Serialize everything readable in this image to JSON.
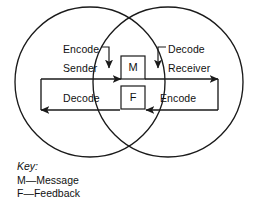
{
  "diagram": {
    "type": "venn-two-circle-communication-model",
    "labels": {
      "encode_left": "Encode",
      "sender": "Sender",
      "decode_left": "Decode",
      "decode_right": "Decode",
      "receiver": "Receiver",
      "encode_right": "Encode"
    },
    "center_boxes": [
      {
        "glyph": "M",
        "meaning": "Message"
      },
      {
        "glyph": "F",
        "meaning": "Feedback"
      }
    ],
    "colors": {
      "stroke": "#1a1a1a",
      "text": "#111111",
      "background": "#ffffff"
    }
  },
  "key": {
    "title": "Key:",
    "entries": [
      "M—Message",
      "F—Feedback"
    ]
  }
}
